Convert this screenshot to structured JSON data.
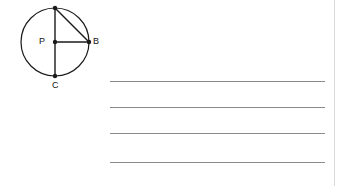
{
  "page": {
    "width": 343,
    "height": 186,
    "background_color": "#ffffff",
    "kind": "worksheet-figure-with-answer-lines"
  },
  "diagram": {
    "name": "circle-with-radii-and-chord",
    "stroke_color": "#1a1a1a",
    "fill_color": "none",
    "circle": {
      "center_label": "P",
      "center_x": 55,
      "center_y": 42,
      "radius": 34
    },
    "points": [
      {
        "label": "A",
        "x": 55,
        "y": 8,
        "note": "top-of-circle, label clipped by image edge"
      },
      {
        "label": "P",
        "x": 55,
        "y": 42,
        "note": "center"
      },
      {
        "label": "B",
        "x": 89,
        "y": 42,
        "note": "right-of-circle"
      },
      {
        "label": "C",
        "x": 55,
        "y": 76,
        "note": "bottom-of-circle"
      }
    ],
    "segments": [
      {
        "name": "radius-PA",
        "from": "P",
        "to": "A"
      },
      {
        "name": "radius-PB",
        "from": "P",
        "to": "B"
      },
      {
        "name": "radius-PC",
        "from": "P",
        "to": "C"
      },
      {
        "name": "chord-AB",
        "from": "A",
        "to": "B"
      }
    ],
    "labels": {
      "a": "",
      "p": "P",
      "b": "B",
      "c": "C"
    }
  },
  "answer_lines": {
    "name": "blank-answer-lines",
    "count": 4,
    "color": "#8a8a8a",
    "left": 110,
    "right": 325,
    "values": [
      "",
      "",
      "",
      ""
    ],
    "tops": [
      81,
      107,
      133,
      162
    ]
  },
  "margin_rule": {
    "color": "#d8d8d8",
    "x": 334
  }
}
